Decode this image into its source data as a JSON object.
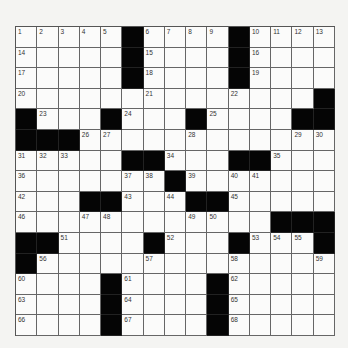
{
  "puzzle": {
    "rows": 15,
    "cols": 15,
    "layout": [
      "1 2 3 4 5 # 6 7 8 9 # 10 11 12 13",
      "14 . . . . # 15 . . . # 16 . . .",
      "17 . . . . # 18 . . . # 19 . . .",
      "20 . . . . . 21 . . . 22 . . . #",
      "# 23 . . # 24 . . # 25 . . . # #",
      "# # # 26 27 . . . 28 . . . . 29 30",
      "31 32 33 . . # # 34 . . # # 35 . .",
      "36 . . . . 37 38 # 39 . 40 41 . . .",
      "42 . . # # 43 . 44 # # 45 . . . .",
      "46 . . 47 48 . . . 49 50 . . # # #",
      "# # 51 . . . # 52 . . # 53 54 55 #",
      "# 56 . . . . 57 . . . 58 . . . 59",
      "60 . . . # 61 . . . # 62 . . . .",
      "63 . . . # 64 . . . # 65 . . . .",
      "66 . . . # 67 . . . # 68 . . . ."
    ]
  }
}
